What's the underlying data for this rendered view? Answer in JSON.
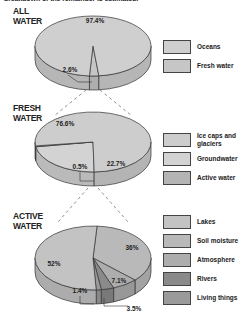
{
  "header": {
    "cut_off_text": "breakdown of the remainder is estimated."
  },
  "chart_data": [
    {
      "type": "pie",
      "title": "ALL WATER",
      "categories": [
        "Oceans",
        "Fresh water"
      ],
      "values": [
        97.4,
        2.6
      ],
      "labels": [
        "97.4%",
        "2.6%"
      ],
      "colors": [
        "#cfcfcf",
        "#c6c6c6"
      ],
      "legend": "right"
    },
    {
      "type": "pie",
      "title": "FRESH WATER",
      "categories": [
        "Ice caps and glaciers",
        "Groundwater",
        "Active water"
      ],
      "values": [
        76.6,
        22.7,
        0.5
      ],
      "labels": [
        "76.6%",
        "22.7%",
        "0.5%"
      ],
      "colors": [
        "#cdcdcd",
        "#d3d3d3",
        "#b4b4b4"
      ],
      "legend": "right"
    },
    {
      "type": "pie",
      "title": "ACTIVE WATER",
      "categories": [
        "Lakes",
        "Soil moisture",
        "Atmosphere",
        "Rivers",
        "Living things"
      ],
      "values": [
        52,
        36,
        7.1,
        3.5,
        1.4
      ],
      "labels": [
        "52%",
        "36%",
        "7.1%",
        "3.5%",
        "1.4%"
      ],
      "colors": [
        "#c3c3c3",
        "#b9b9b9",
        "#adadad",
        "#8a8a8a",
        "#9a9a9a"
      ],
      "legend": "right"
    }
  ],
  "sections": [
    {
      "title_line1": "ALL",
      "title_line2": "WATER"
    },
    {
      "title_line1": "FRESH",
      "title_line2": "WATER"
    },
    {
      "title_line1": "ACTIVE",
      "title_line2": "WATER"
    }
  ]
}
